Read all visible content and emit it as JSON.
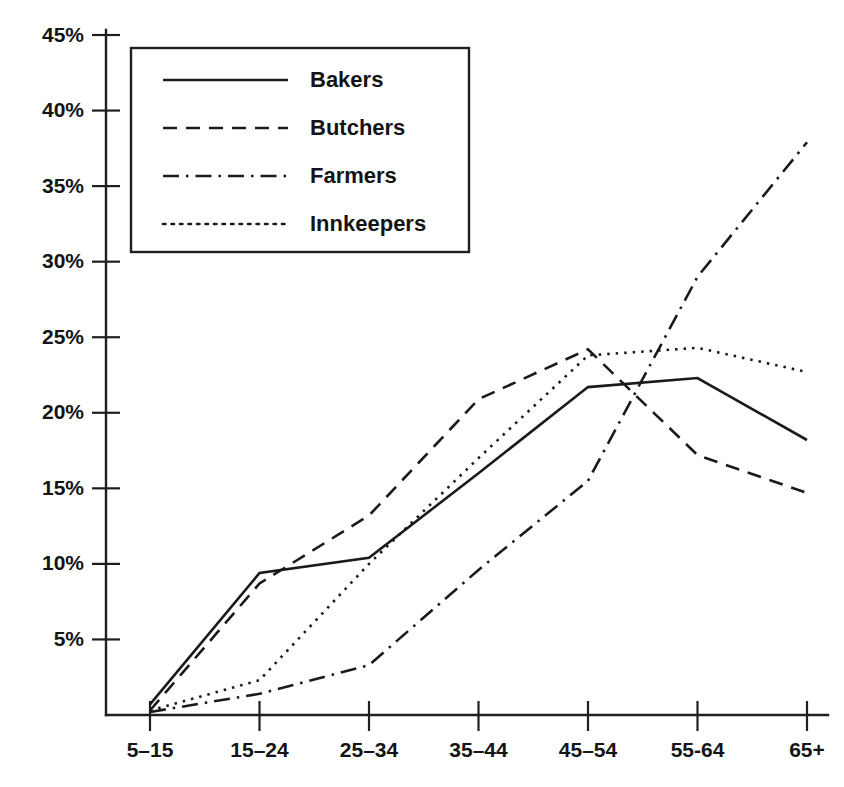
{
  "chart_data": {
    "type": "line",
    "title": "",
    "xlabel": "",
    "ylabel": "",
    "categories": [
      "5–15",
      "15–24",
      "25–34",
      "35–44",
      "45–54",
      "55-64",
      "65+"
    ],
    "x_tick_labels": [
      "5–15",
      "15–24",
      "25–34",
      "35–44",
      "45–54",
      "55-64",
      "65+"
    ],
    "y_tick_labels": [
      "5%",
      "10%",
      "15%",
      "20%",
      "25%",
      "30%",
      "35%",
      "40%",
      "45%"
    ],
    "y_tick_values": [
      5,
      10,
      15,
      20,
      25,
      30,
      35,
      40,
      45
    ],
    "ylim": [
      0,
      45
    ],
    "y_unit": "%",
    "grid": false,
    "legend_position": "top-left",
    "series": [
      {
        "name": "Bakers",
        "style": "solid",
        "dash": "none",
        "color": "#1a1a1a",
        "values": [
          0.7,
          9.4,
          10.4,
          16.0,
          21.7,
          22.3,
          18.2
        ]
      },
      {
        "name": "Butchers",
        "style": "dashed",
        "dash": "14,9",
        "color": "#1a1a1a",
        "values": [
          0.3,
          8.7,
          13.2,
          20.9,
          24.2,
          17.2,
          14.7
        ]
      },
      {
        "name": "Farmers",
        "style": "dash-dot",
        "dash": "16,7,2.5,7",
        "color": "#1a1a1a",
        "values": [
          0.2,
          1.4,
          3.3,
          9.6,
          15.5,
          29.0,
          37.9
        ]
      },
      {
        "name": "Innkeepers",
        "style": "dotted",
        "dash": "2.5,6",
        "color": "#1a1a1a",
        "values": [
          0.3,
          2.3,
          10.0,
          17.0,
          23.8,
          24.3,
          22.7
        ]
      }
    ]
  },
  "legend": {
    "entries": [
      {
        "label": "Bakers"
      },
      {
        "label": "Butchers"
      },
      {
        "label": "Farmers"
      },
      {
        "label": "Innkeepers"
      }
    ]
  },
  "axes": {
    "y_ticks": [
      {
        "label": "45%",
        "value": 45
      },
      {
        "label": "40%",
        "value": 40
      },
      {
        "label": "35%",
        "value": 35
      },
      {
        "label": "30%",
        "value": 30
      },
      {
        "label": "25%",
        "value": 25
      },
      {
        "label": "20%",
        "value": 20
      },
      {
        "label": "15%",
        "value": 15
      },
      {
        "label": "10%",
        "value": 10
      },
      {
        "label": "5%",
        "value": 5
      }
    ],
    "x_ticks": [
      {
        "label": "5–15"
      },
      {
        "label": "15–24"
      },
      {
        "label": "25–34"
      },
      {
        "label": "35–44"
      },
      {
        "label": "45–54"
      },
      {
        "label": "55-64"
      },
      {
        "label": "65+"
      }
    ]
  }
}
